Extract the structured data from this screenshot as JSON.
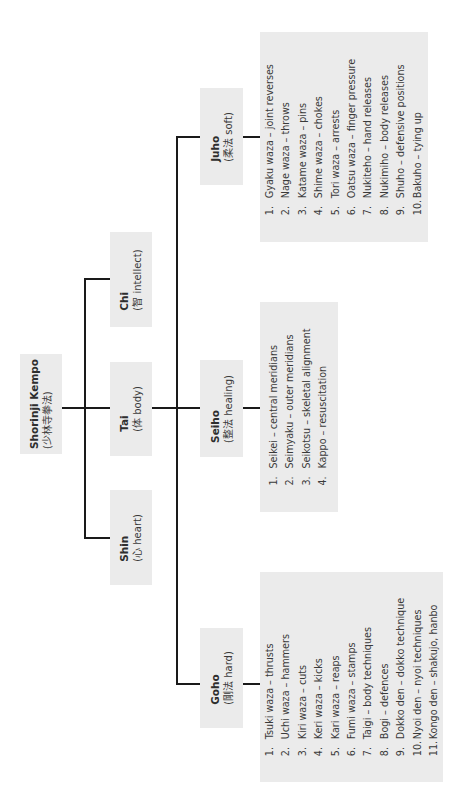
{
  "diagram": {
    "root": {
      "title": "Shorinji Kempo",
      "subtitle": "(少林寺拳法)"
    },
    "pillars": [
      {
        "id": "chi",
        "title": "Chi",
        "subtitle": "(智 intellect)"
      },
      {
        "id": "tai",
        "title": "Tai",
        "subtitle": "(体 body)"
      },
      {
        "id": "shin",
        "title": "Shin",
        "subtitle": "(心 heart)"
      }
    ],
    "branches": [
      {
        "id": "juho",
        "title": "Juho",
        "subtitle": "(柔法 soft)",
        "items": [
          {
            "num": "1.",
            "text": "Gyaku waza – joint reverses"
          },
          {
            "num": "2.",
            "text": "Nage waza – throws"
          },
          {
            "num": "3.",
            "text": "Katame waza – pins"
          },
          {
            "num": "4.",
            "text": "Shime waza – chokes"
          },
          {
            "num": "5.",
            "text": "Tori waza – arrests"
          },
          {
            "num": "6.",
            "text": "Oatsu waza – finger pressure"
          },
          {
            "num": "7.",
            "text": "Nukiteho – hand releases"
          },
          {
            "num": "8.",
            "text": "Nukimiho – body releases"
          },
          {
            "num": "9.",
            "text": "Shuho – defensive positions"
          },
          {
            "num": "10.",
            "text": "Bakuho – tying up"
          }
        ]
      },
      {
        "id": "seiho",
        "title": "Seiho",
        "subtitle": "(整法 healing)",
        "items": [
          {
            "num": "1.",
            "text": "Seikei – central meridians"
          },
          {
            "num": "2.",
            "text": "Seimyaku – outer meridians"
          },
          {
            "num": "3.",
            "text": "Seikotsu – skeletal alignment"
          },
          {
            "num": "4.",
            "text": "Kappo – resuscitation"
          }
        ]
      },
      {
        "id": "goho",
        "title": "Goho",
        "subtitle": "(剛法 hard)",
        "items": [
          {
            "num": "1.",
            "text": "Tsuki waza – thrusts"
          },
          {
            "num": "2.",
            "text": "Uchi waza – hammers"
          },
          {
            "num": "3.",
            "text": "Kiri waza – cuts"
          },
          {
            "num": "4.",
            "text": "Keri waza – kicks"
          },
          {
            "num": "5.",
            "text": "Kari waza – reaps"
          },
          {
            "num": "6.",
            "text": "Fumi waza – stamps"
          },
          {
            "num": "7.",
            "text": "Taigi – body techniques"
          },
          {
            "num": "8.",
            "text": "Bogi – defences"
          },
          {
            "num": "9.",
            "text": "Dokko den – dokko technique"
          },
          {
            "num": "10.",
            "text": "Nyoi den – nyoi techniques"
          },
          {
            "num": "11.",
            "text": "Kongo den – shakujo, hanbo"
          }
        ]
      }
    ]
  },
  "colors": {
    "box": "#ebebeb",
    "line": "#1a1a1a",
    "text": "#3a3a3a",
    "background": "#ffffff"
  }
}
